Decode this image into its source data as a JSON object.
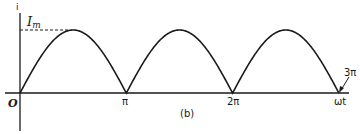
{
  "chart_data": {
    "type": "line",
    "title": "",
    "subtitle": "(b)",
    "xlabel": "ωt",
    "ylabel": "i",
    "x_ticks": [
      "O",
      "π",
      "2π",
      "3π"
    ],
    "x_tick_values": [
      0,
      3.1416,
      6.2832,
      9.4248
    ],
    "y_annotation": "Im",
    "series": [
      {
        "name": "i",
        "function": "Im*|sin(ωt)|",
        "x": [
          0,
          0.785,
          1.571,
          2.356,
          3.142,
          3.927,
          4.712,
          5.498,
          6.283,
          7.069,
          7.854,
          8.639,
          9.425
        ],
        "values": [
          0,
          0.707,
          1.0,
          0.707,
          0,
          0.707,
          1.0,
          0.707,
          0,
          0.707,
          1.0,
          0.707,
          0
        ]
      }
    ],
    "ylim": [
      0,
      1
    ],
    "grid": false,
    "legend": "none"
  },
  "labels": {
    "y_axis": "i",
    "peak": "I",
    "peak_sub": "m",
    "origin": "O",
    "pi": "π",
    "two_pi": "2π",
    "three_pi": "3π",
    "x_axis": "ωt",
    "caption": "(b)"
  },
  "colors": {
    "ink": "#1a1a1a",
    "background": "#ffffff"
  }
}
